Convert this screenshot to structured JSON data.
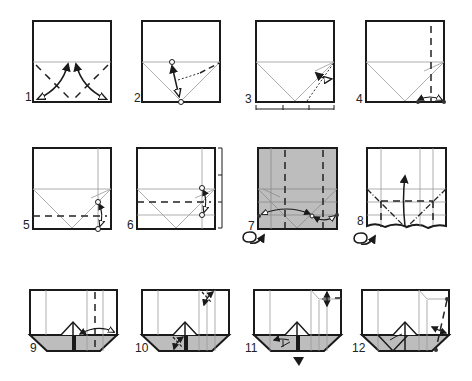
{
  "diagram": {
    "type": "origami-instructions",
    "colors": {
      "paper": "#ffffff",
      "paper_back": "#bdbdbd",
      "outline": "#1a1a1a",
      "crease": "#9a9a9a",
      "fold_line": "#222222"
    },
    "steps": [
      {
        "number": "1",
        "label": "1"
      },
      {
        "number": "2",
        "label": "2"
      },
      {
        "number": "3",
        "label": "3"
      },
      {
        "number": "4",
        "label": "4"
      },
      {
        "number": "5",
        "label": "5"
      },
      {
        "number": "6",
        "label": "6"
      },
      {
        "number": "7",
        "label": "7"
      },
      {
        "number": "8",
        "label": "8"
      },
      {
        "number": "9",
        "label": "9"
      },
      {
        "number": "10",
        "label": "10"
      },
      {
        "number": "11",
        "label": "11"
      },
      {
        "number": "12",
        "label": "12"
      }
    ],
    "symbols": {
      "turn_over": "turn-over-icon",
      "push": "push-arrow-icon",
      "measure_bracket": "measure-bracket-icon"
    }
  }
}
